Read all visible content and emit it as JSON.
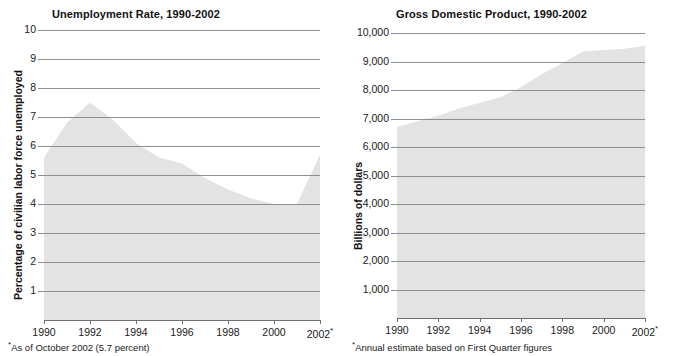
{
  "colors": {
    "area_fill": "#e3e3e3",
    "gridline": "#8e8e8e",
    "axis": "#6f6f6f",
    "text": "#1a1a1a",
    "background": "#ffffff"
  },
  "panels": [
    {
      "id": "unemployment",
      "title": "Unemployment Rate, 1990-2002",
      "y_axis_label": "Percentage of civilian labor force unemployed",
      "footnote_marker": "*",
      "footnote": "As of October 2002 (5.7 percent)",
      "x_last_marker": "*"
    },
    {
      "id": "gdp",
      "title": "Gross Domestic Product, 1990-2002",
      "y_axis_label": "Billions of dollars",
      "footnote_marker": "*",
      "footnote": "Annual estimate based on First Quarter figures",
      "x_last_marker": "*"
    }
  ],
  "chart_data": [
    {
      "type": "area",
      "id": "unemployment",
      "title": "Unemployment Rate, 1990-2002",
      "xlabel": "",
      "ylabel": "Percentage of civilian labor force unemployed",
      "x": [
        1990,
        1991,
        1992,
        1993,
        1994,
        1995,
        1996,
        1997,
        1998,
        1999,
        2000,
        2001,
        2002
      ],
      "values": [
        5.6,
        6.8,
        7.5,
        6.9,
        6.1,
        5.6,
        5.4,
        4.9,
        4.5,
        4.2,
        4.0,
        4.0,
        5.7
      ],
      "ylim": [
        0,
        10
      ],
      "yticks": [
        1,
        2,
        3,
        4,
        5,
        6,
        7,
        8,
        9,
        10
      ],
      "ytick_labels": [
        "1",
        "2",
        "3",
        "4",
        "5",
        "6",
        "7",
        "8",
        "9",
        "10"
      ],
      "xticks": [
        1990,
        1992,
        1994,
        1996,
        1998,
        2000,
        2002
      ],
      "xtick_labels": [
        "1990",
        "1992",
        "1994",
        "1996",
        "1998",
        "2000",
        "2002"
      ],
      "grid": true,
      "legend": "none",
      "annotations": [
        "*As of October 2002 (5.7 percent)"
      ]
    },
    {
      "type": "area",
      "id": "gdp",
      "title": "Gross Domestic Product, 1990-2002",
      "xlabel": "",
      "ylabel": "Billions of dollars",
      "x": [
        1990,
        1991,
        1992,
        1993,
        1994,
        1995,
        1996,
        1997,
        1998,
        1999,
        2000,
        2001,
        2002
      ],
      "values": [
        6700,
        6900,
        7100,
        7350,
        7550,
        7750,
        8100,
        8550,
        8950,
        9350,
        9400,
        9450,
        9550
      ],
      "ylim": [
        0,
        10000
      ],
      "yticks": [
        1000,
        2000,
        3000,
        4000,
        5000,
        6000,
        7000,
        8000,
        9000,
        10000
      ],
      "ytick_labels": [
        "1,000",
        "2,000",
        "3,000",
        "4,000",
        "5,000",
        "6,000",
        "7,000",
        "8,000",
        "9,000",
        "10,000"
      ],
      "xticks": [
        1990,
        1992,
        1994,
        1996,
        1998,
        2000,
        2002
      ],
      "xtick_labels": [
        "1990",
        "1992",
        "1994",
        "1996",
        "1998",
        "2000",
        "2002"
      ],
      "grid": true,
      "legend": "none",
      "annotations": [
        "*Annual estimate based on First Quarter figures"
      ]
    }
  ]
}
